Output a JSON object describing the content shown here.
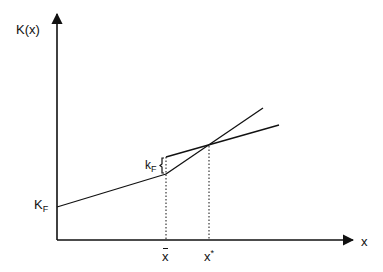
{
  "diagram": {
    "y_axis_label": "K(x)",
    "x_axis_label": "x",
    "intercept_label_main": "K",
    "intercept_label_sub": "F",
    "jump_label_main": "k",
    "jump_label_sub": "F",
    "x_bar_label": "x",
    "x_star_label_main": "x",
    "x_star_label_sup": "*",
    "stroke_color": "#111111"
  }
}
